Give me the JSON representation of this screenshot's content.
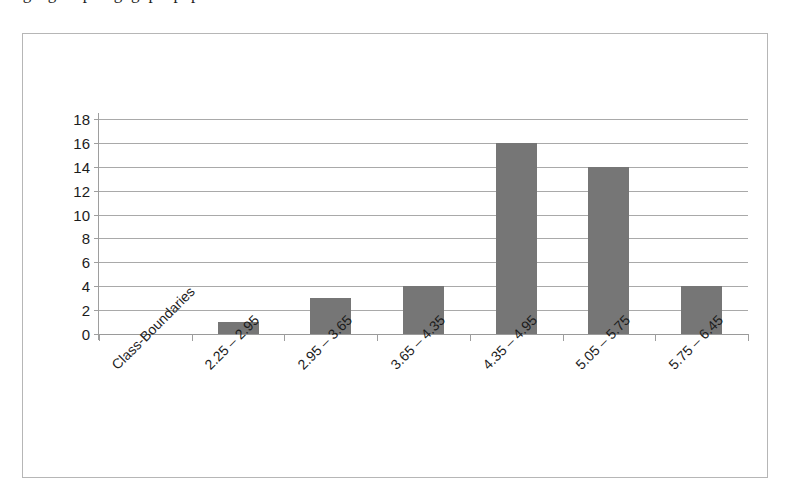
{
  "figure": {
    "clipped_caption_above": "ogengbhuputngnghpenpup",
    "frame_border_color": "#b6b6b6",
    "background_color": "#ffffff"
  },
  "chart_data": {
    "type": "bar",
    "title": "",
    "subtitle": "",
    "xlabel": "",
    "ylabel": "",
    "categories": [
      "Class-Boundaries",
      "2.25 – 2.95",
      "2.95 – 3.65",
      "3.65 – 4.35",
      "4.35 – 4.95",
      "5.05 – 5.75",
      "5.75 – 6.45"
    ],
    "values": [
      0,
      1,
      3,
      4,
      16,
      14,
      4
    ],
    "ylim": [
      0,
      18
    ],
    "ytick_step": 2,
    "ytick_labels": [
      "0",
      "2",
      "4",
      "6",
      "8",
      "10",
      "12",
      "14",
      "16",
      "18"
    ],
    "grid": true,
    "grid_axis": "y",
    "legend": false,
    "legend_position": "none",
    "bar_color": "#767676",
    "gridline_color": "#a9a9a9",
    "axis_color": "#9e9e9e",
    "series": [
      {
        "name": "Frequency",
        "values": [
          0,
          1,
          3,
          4,
          16,
          14,
          4
        ]
      }
    ]
  }
}
